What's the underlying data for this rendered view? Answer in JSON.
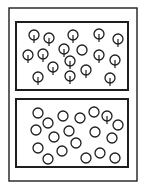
{
  "colors": {
    "stroke": "#1e1e1e",
    "background": "#ffffff"
  },
  "outer_frame": {
    "x": 9,
    "y": 8,
    "w": 128,
    "h": 173
  },
  "panels": [
    {
      "name": "top-panel",
      "x": 16,
      "y": 22,
      "w": 112,
      "h": 68,
      "circles": [
        {
          "cx": 34,
          "cy": 35,
          "stem": true
        },
        {
          "cx": 49,
          "cy": 38,
          "stem": true
        },
        {
          "cx": 73,
          "cy": 35,
          "stem": true
        },
        {
          "cx": 99,
          "cy": 34,
          "stem": true
        },
        {
          "cx": 118,
          "cy": 39,
          "stem": true
        },
        {
          "cx": 28,
          "cy": 55,
          "stem": true
        },
        {
          "cx": 43,
          "cy": 54,
          "stem": true
        },
        {
          "cx": 64,
          "cy": 49,
          "stem": true
        },
        {
          "cx": 82,
          "cy": 50,
          "stem": false
        },
        {
          "cx": 99,
          "cy": 55,
          "stem": true
        },
        {
          "cx": 115,
          "cy": 60,
          "stem": true
        },
        {
          "cx": 70,
          "cy": 61,
          "stem": true
        },
        {
          "cx": 53,
          "cy": 67,
          "stem": true
        },
        {
          "cx": 86,
          "cy": 70,
          "stem": true
        },
        {
          "cx": 38,
          "cy": 77,
          "stem": true
        },
        {
          "cx": 70,
          "cy": 76,
          "stem": true
        },
        {
          "cx": 110,
          "cy": 78,
          "stem": true
        }
      ]
    },
    {
      "name": "bottom-panel",
      "x": 16,
      "y": 99,
      "w": 112,
      "h": 68,
      "circles": [
        {
          "cx": 38,
          "cy": 113,
          "stem": false
        },
        {
          "cx": 48,
          "cy": 123,
          "stem": false
        },
        {
          "cx": 63,
          "cy": 116,
          "stem": false
        },
        {
          "cx": 80,
          "cy": 118,
          "stem": false
        },
        {
          "cx": 94,
          "cy": 112,
          "stem": false
        },
        {
          "cx": 107,
          "cy": 116,
          "stem": true
        },
        {
          "cx": 118,
          "cy": 125,
          "stem": false
        },
        {
          "cx": 36,
          "cy": 130,
          "stem": false
        },
        {
          "cx": 54,
          "cy": 137,
          "stem": false
        },
        {
          "cx": 69,
          "cy": 131,
          "stem": false
        },
        {
          "cx": 95,
          "cy": 132,
          "stem": false
        },
        {
          "cx": 112,
          "cy": 138,
          "stem": false
        },
        {
          "cx": 38,
          "cy": 148,
          "stem": false
        },
        {
          "cx": 76,
          "cy": 143,
          "stem": false
        },
        {
          "cx": 62,
          "cy": 151,
          "stem": false
        },
        {
          "cx": 48,
          "cy": 159,
          "stem": false
        },
        {
          "cx": 86,
          "cy": 158,
          "stem": false
        },
        {
          "cx": 100,
          "cy": 153,
          "stem": false
        },
        {
          "cx": 115,
          "cy": 158,
          "stem": false
        }
      ]
    }
  ],
  "circle_radius": 5
}
